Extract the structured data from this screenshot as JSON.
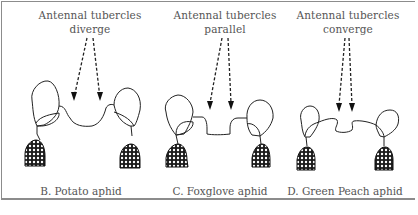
{
  "figure": {
    "panels": [
      {
        "id": "B",
        "annotation_line1": "Antennal tubercles",
        "annotation_line2": "diverge",
        "caption": "B. Potato aphid"
      },
      {
        "id": "C",
        "annotation_line1": "Antennal tubercles",
        "annotation_line2": "parallel",
        "caption": "C. Foxglove aphid"
      },
      {
        "id": "D",
        "annotation_line1": "Antennal tubercles",
        "annotation_line2": "converge",
        "caption": "D. Green Peach aphid"
      }
    ],
    "colors": {
      "ink": "#222222",
      "text": "#555555",
      "border": "#8c8c8c"
    }
  }
}
